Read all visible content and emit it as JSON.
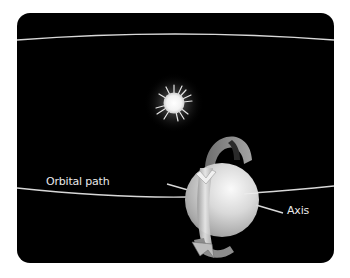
{
  "diagram": {
    "labels": {
      "orbital_path": "Orbital path",
      "axis": "Axis"
    },
    "elements": {
      "star": "sun",
      "planet": "planet-sphere",
      "rotation_arrow": "rotation-arrow",
      "orbit_lines": [
        "far-orbit-line",
        "near-orbit-line"
      ]
    },
    "colors": {
      "background": "#000000",
      "page": "#ffffff",
      "line": "#d8d8d8",
      "text": "#e8e8e8"
    }
  }
}
